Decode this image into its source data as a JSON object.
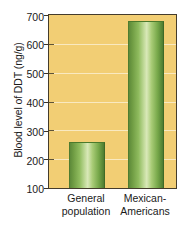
{
  "chart_data": {
    "type": "bar",
    "title": "",
    "xlabel": "",
    "ylabel": "Blood level of DDT (ng/g)",
    "categories": [
      "General population",
      "Mexican-Americans"
    ],
    "category_lines": [
      [
        "General",
        "population"
      ],
      [
        "Mexican-",
        "Americans"
      ]
    ],
    "values": [
      260,
      680
    ],
    "ylim": [
      100,
      700
    ],
    "yticks": [
      100,
      200,
      300,
      400,
      500,
      600,
      700
    ],
    "ytick_labels": [
      "100",
      "200",
      "300",
      "400",
      "500",
      "600",
      "700"
    ],
    "grid": true,
    "legend": "none",
    "colors": {
      "plot_background": "#f2ce74",
      "bar_edge": "#4e7c30",
      "bar_light": "#d9e8b8",
      "bar_dark": "#5d8a3a",
      "axis": "#443c2c",
      "text": "#1a1a1a",
      "gridline": "#ffffff"
    }
  }
}
